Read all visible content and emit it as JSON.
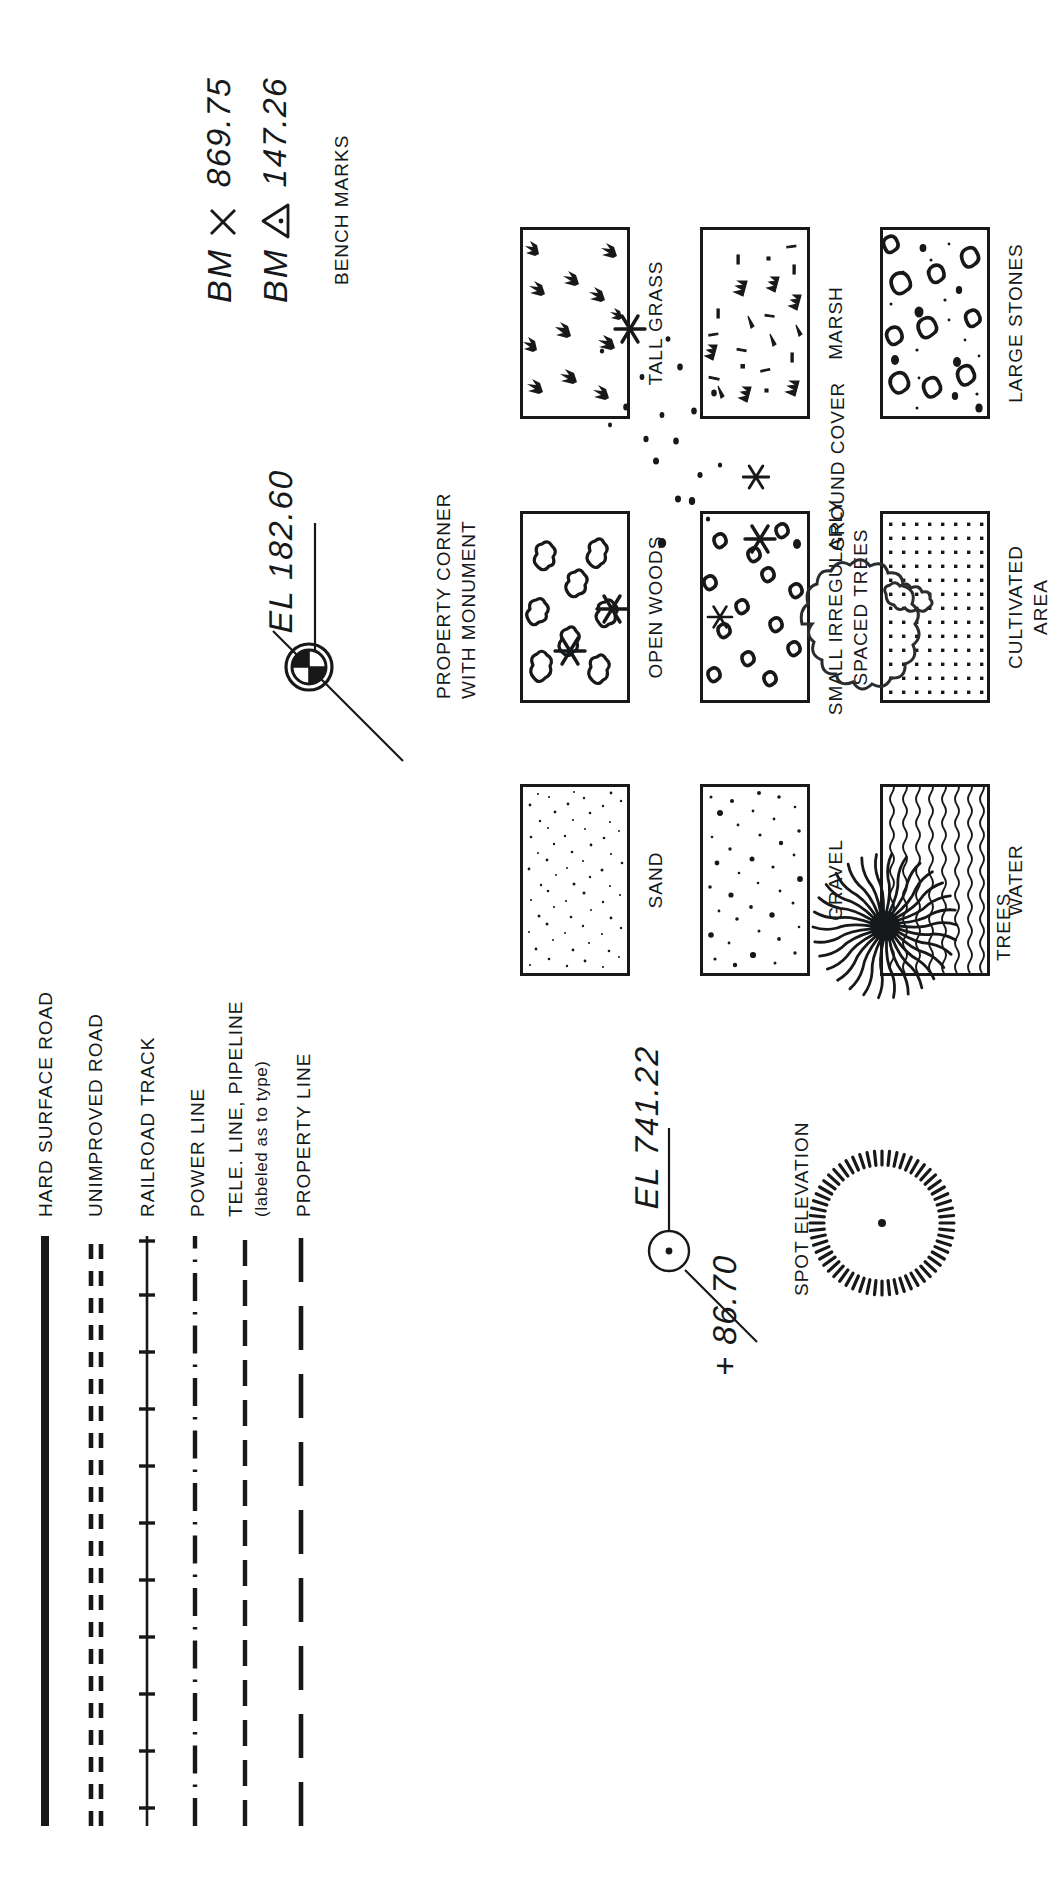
{
  "sheet": {
    "title": "Topographic and Survey Map Symbols Legend",
    "ink_color": "#16181a",
    "paper_color": "#ffffff"
  },
  "line_symbols": {
    "section_name": "line-symbols",
    "items": [
      {
        "id": "hard-surface-road",
        "label": "HARD SURFACE ROAD",
        "style": "solid-thick"
      },
      {
        "id": "unimproved-road",
        "label": "UNIMPROVED ROAD",
        "style": "double-dashed"
      },
      {
        "id": "railroad-track",
        "label": "RAILROAD TRACK",
        "style": "solid-with-ties"
      },
      {
        "id": "power-line",
        "label": "POWER LINE",
        "style": "dash-dot"
      },
      {
        "id": "tele-line-pipeline",
        "label": "TELE. LINE, PIPELINE",
        "sublabel": "(labeled as to type)",
        "style": "long-dash"
      },
      {
        "id": "property-line",
        "label": "PROPERTY LINE",
        "style": "long-dash-wide"
      }
    ]
  },
  "area_symbols": {
    "section_name": "area-symbols",
    "columns": [
      {
        "items": [
          {
            "id": "sand",
            "label": "SAND",
            "fill": "fine-stipple"
          },
          {
            "id": "open-woods",
            "label": "OPEN WOODS",
            "fill": "cloud-blobs"
          },
          {
            "id": "tall-grass",
            "label": "TALL GRASS",
            "fill": "grass-tufts"
          }
        ]
      },
      {
        "items": [
          {
            "id": "gravel",
            "label": "GRAVEL",
            "fill": "coarse-dots"
          },
          {
            "id": "small-irregular-trees",
            "label": "SMALL IRREGULARLY\nSPACED TREES",
            "fill": "small-blobs"
          },
          {
            "id": "marsh",
            "label": "MARSH",
            "fill": "marsh-tufts"
          }
        ]
      },
      {
        "items": [
          {
            "id": "water",
            "label": "WATER",
            "fill": "wavy-lines"
          },
          {
            "id": "cultivated-area",
            "label": "CULTIVATED\nAREA",
            "fill": "dot-grid"
          },
          {
            "id": "large-stones",
            "label": "LARGE STONES",
            "fill": "stones"
          }
        ]
      }
    ]
  },
  "point_symbols": {
    "section_name": "point-symbols",
    "spot_elevation": {
      "id": "spot-elevation",
      "label": "SPOT ELEVATION",
      "values": [
        "+ 86.70",
        "EL 741.22"
      ]
    },
    "property_corner": {
      "id": "property-corner-with-monument",
      "label": "PROPERTY CORNER\nWITH MONUMENT",
      "values": [
        "EL 182.60"
      ]
    },
    "bench_marks": {
      "id": "bench-marks",
      "label": "BENCH MARKS",
      "rows": [
        {
          "prefix": "BM",
          "marker": "cross",
          "value": "869.75"
        },
        {
          "prefix": "BM",
          "marker": "triangle",
          "value": "147.26"
        }
      ]
    }
  },
  "vegetation_symbols": {
    "section_name": "vegetation-symbols",
    "trees": {
      "id": "trees",
      "label": "TREES",
      "variants": [
        "conifer-ring",
        "deciduous-burst",
        "canopy-outline"
      ]
    },
    "ground_cover": {
      "id": "ground-cover",
      "label": "GROUND COVER",
      "variants": [
        "asterisk-cluster",
        "speckle-cluster"
      ]
    }
  }
}
